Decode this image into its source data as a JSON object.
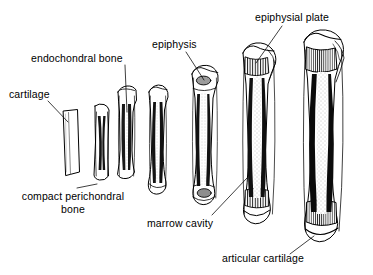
{
  "figure": {
    "background_color": "#ffffff",
    "ink_color": "#000000",
    "stage_count": 7
  },
  "labels": {
    "cartilage": "cartilage",
    "endochondral_bone": "endochondral bone",
    "compact_perichondral_bone_line1": "compact perichondral",
    "compact_perichondral_bone_line2": "bone",
    "epiphysis": "epiphysis",
    "epiphysial_plate": "epiphysial plate",
    "marrow_cavity": "marrow cavity",
    "articular_cartilage": "articular cartilage"
  },
  "stages": [
    {
      "index": 1,
      "name": "cartilage-model",
      "features": [
        "hyaline cartilage model"
      ],
      "height_px": 66,
      "top_px": 110
    },
    {
      "index": 2,
      "name": "perichondral-bone-collar",
      "features": [
        "compact perichondral bone collar"
      ],
      "height_px": 78,
      "top_px": 103
    },
    {
      "index": 3,
      "name": "endochondral-bone-forming",
      "features": [
        "endochondral bone",
        "bone collar thickening"
      ],
      "height_px": 92,
      "top_px": 86
    },
    {
      "index": 4,
      "name": "primary-marrow-cavity",
      "features": [
        "marrow cavity",
        "spongy bone"
      ],
      "height_px": 112,
      "top_px": 84
    },
    {
      "index": 5,
      "name": "secondary-ossification-centres",
      "features": [
        "epiphysis",
        "secondary ossification centre"
      ],
      "height_px": 142,
      "top_px": 60
    },
    {
      "index": 6,
      "name": "epiphysial-plates",
      "features": [
        "epiphysial plate",
        "marrow cavity",
        "articular cartilage"
      ],
      "height_px": 180,
      "top_px": 42
    },
    {
      "index": 7,
      "name": "mature-long-bone",
      "features": [
        "epiphysial plate",
        "marrow cavity",
        "articular cartilage",
        "compact cortex"
      ],
      "height_px": 215,
      "top_px": 30
    }
  ]
}
